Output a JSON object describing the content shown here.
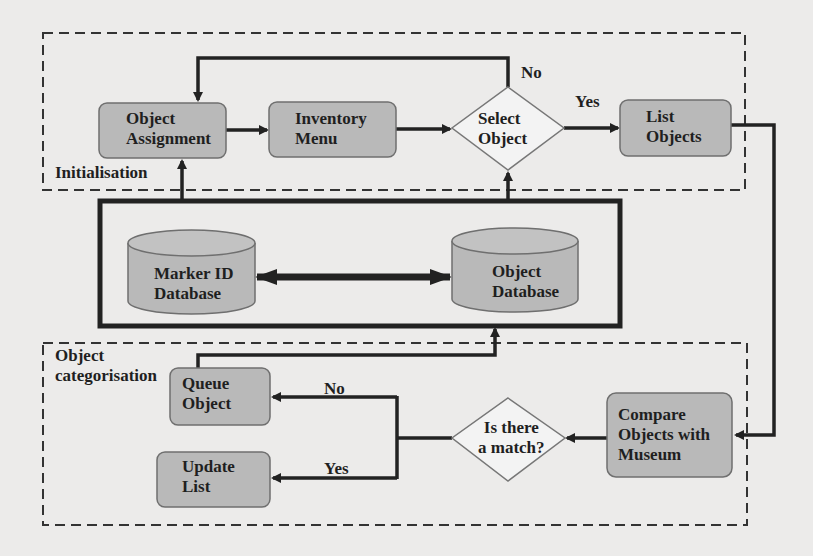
{
  "groups": {
    "initialisation": {
      "label": "Initialisation"
    },
    "categorisation": {
      "label": "Object\ncategorisation"
    }
  },
  "nodes": {
    "object_assignment": {
      "label": "Object\nAssignment",
      "shape": "rounded-rect"
    },
    "inventory_menu": {
      "label": "Inventory\nMenu",
      "shape": "rounded-rect"
    },
    "select_object": {
      "label": "Select\nObject",
      "shape": "diamond"
    },
    "list_objects": {
      "label": "List\nObjects",
      "shape": "rounded-rect"
    },
    "marker_id_db": {
      "label": "Marker ID\nDatabase",
      "shape": "cylinder"
    },
    "object_db": {
      "label": "Object\nDatabase",
      "shape": "cylinder"
    },
    "queue_object": {
      "label": "Queue\nObject",
      "shape": "rounded-rect"
    },
    "update_list": {
      "label": "Update\nList",
      "shape": "rounded-rect"
    },
    "compare_objects": {
      "label": "Compare\nObjects with\nMuseum",
      "shape": "rounded-rect"
    },
    "is_match": {
      "label": "Is there\na match?",
      "shape": "diamond"
    }
  },
  "edges": {
    "select_no": {
      "label": "No"
    },
    "select_yes": {
      "label": "Yes"
    },
    "match_no": {
      "label": "No"
    },
    "match_yes": {
      "label": "Yes"
    }
  },
  "colors": {
    "node_fill": "#b9b9b9",
    "node_stroke": "#6f6f6f",
    "line": "#222222",
    "background": "#ecebea"
  }
}
